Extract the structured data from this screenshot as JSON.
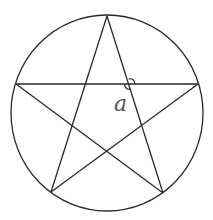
{
  "figure": {
    "stroke_color": "#2a2a2a",
    "label_color": "#555555",
    "circle": {
      "cx": 107,
      "cy": 113,
      "rx": 96,
      "ry": 98
    },
    "vertices": {
      "top": [
        107,
        16
      ],
      "left": [
        16,
        84
      ],
      "right": [
        198,
        84
      ],
      "bottom_left": [
        51,
        192
      ],
      "bottom_right": [
        163,
        193
      ]
    },
    "segments": [
      [
        "top",
        "bottom_left"
      ],
      [
        "top",
        "bottom_right"
      ],
      [
        "left",
        "right"
      ],
      [
        "left",
        "bottom_right"
      ],
      [
        "right",
        "bottom_left"
      ]
    ],
    "angle_marker": {
      "at": [
        130,
        84
      ],
      "radius": 5
    },
    "angle_label": "a"
  }
}
